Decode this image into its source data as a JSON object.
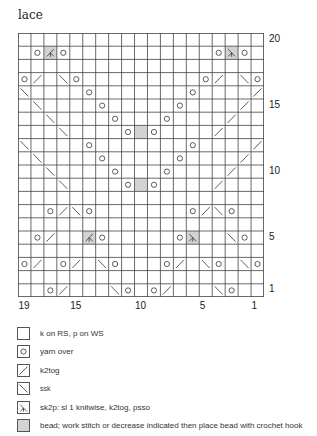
{
  "title": "lace",
  "chart": {
    "columns": 19,
    "rows": 20,
    "row_labels": [
      {
        "label": "20",
        "row": 20
      },
      {
        "label": "15",
        "row": 15
      },
      {
        "label": "10",
        "row": 10
      },
      {
        "label": "5",
        "row": 5
      },
      {
        "label": "1",
        "row": 1
      }
    ],
    "col_labels": [
      {
        "label": "19",
        "col": 19
      },
      {
        "label": "15",
        "col": 15
      },
      {
        "label": "10",
        "col": 10
      },
      {
        "label": "5",
        "col": 5
      },
      {
        "label": "1",
        "col": 1
      }
    ],
    "bead_color": "#d3d3d3",
    "line_color": "#333333",
    "rows_data": {
      "20": [],
      "19": [
        {
          "i": 1,
          "s": "yo"
        },
        {
          "i": 2,
          "s": "sk2p-l",
          "bead": true
        },
        {
          "i": 3,
          "s": "yo"
        },
        {
          "i": 15,
          "s": "yo"
        },
        {
          "i": 16,
          "s": "sk2p-r",
          "bead": true
        },
        {
          "i": 17,
          "s": "yo"
        }
      ],
      "18": [],
      "17": [
        {
          "i": 0,
          "s": "yo"
        },
        {
          "i": 1,
          "s": "k2tog"
        },
        {
          "i": 3,
          "s": "ssk"
        },
        {
          "i": 4,
          "s": "yo"
        },
        {
          "i": 14,
          "s": "yo"
        },
        {
          "i": 15,
          "s": "k2tog"
        },
        {
          "i": 17,
          "s": "ssk"
        },
        {
          "i": 18,
          "s": "yo"
        }
      ],
      "16": [
        {
          "i": 0,
          "s": "ssk"
        },
        {
          "i": 5,
          "s": "yo"
        },
        {
          "i": 13,
          "s": "yo"
        },
        {
          "i": 18,
          "s": "k2tog"
        }
      ],
      "15": [
        {
          "i": 1,
          "s": "ssk"
        },
        {
          "i": 6,
          "s": "yo"
        },
        {
          "i": 12,
          "s": "yo"
        },
        {
          "i": 17,
          "s": "k2tog"
        }
      ],
      "14": [
        {
          "i": 2,
          "s": "ssk"
        },
        {
          "i": 7,
          "s": "yo"
        },
        {
          "i": 11,
          "s": "yo"
        },
        {
          "i": 16,
          "s": "k2tog"
        }
      ],
      "13": [
        {
          "i": 3,
          "s": "ssk"
        },
        {
          "i": 8,
          "s": "yo"
        },
        {
          "i": 9,
          "s": "knit",
          "bead": true
        },
        {
          "i": 10,
          "s": "yo"
        },
        {
          "i": 15,
          "s": "k2tog"
        }
      ],
      "12": [
        {
          "i": 0,
          "s": "ssk"
        },
        {
          "i": 5,
          "s": "yo"
        },
        {
          "i": 13,
          "s": "yo"
        },
        {
          "i": 18,
          "s": "k2tog"
        }
      ],
      "11": [
        {
          "i": 1,
          "s": "ssk"
        },
        {
          "i": 6,
          "s": "yo"
        },
        {
          "i": 12,
          "s": "yo"
        },
        {
          "i": 17,
          "s": "k2tog"
        }
      ],
      "10": [
        {
          "i": 2,
          "s": "ssk"
        },
        {
          "i": 7,
          "s": "yo"
        },
        {
          "i": 11,
          "s": "yo"
        },
        {
          "i": 16,
          "s": "k2tog"
        }
      ],
      "9": [
        {
          "i": 3,
          "s": "ssk"
        },
        {
          "i": 8,
          "s": "yo"
        },
        {
          "i": 9,
          "s": "knit",
          "bead": true
        },
        {
          "i": 10,
          "s": "yo"
        },
        {
          "i": 15,
          "s": "k2tog"
        }
      ],
      "8": [],
      "7": [
        {
          "i": 2,
          "s": "yo"
        },
        {
          "i": 3,
          "s": "k2tog"
        },
        {
          "i": 4,
          "s": "ssk"
        },
        {
          "i": 5,
          "s": "yo"
        },
        {
          "i": 13,
          "s": "yo"
        },
        {
          "i": 14,
          "s": "k2tog"
        },
        {
          "i": 15,
          "s": "ssk"
        },
        {
          "i": 16,
          "s": "yo"
        }
      ],
      "6": [],
      "5": [
        {
          "i": 1,
          "s": "yo"
        },
        {
          "i": 2,
          "s": "k2tog"
        },
        {
          "i": 5,
          "s": "sk2p-l",
          "bead": true
        },
        {
          "i": 6,
          "s": "yo"
        },
        {
          "i": 12,
          "s": "yo"
        },
        {
          "i": 13,
          "s": "sk2p-r",
          "bead": true
        },
        {
          "i": 16,
          "s": "ssk"
        },
        {
          "i": 17,
          "s": "yo"
        }
      ],
      "4": [],
      "3": [
        {
          "i": 0,
          "s": "yo"
        },
        {
          "i": 1,
          "s": "k2tog"
        },
        {
          "i": 3,
          "s": "yo"
        },
        {
          "i": 4,
          "s": "k2tog"
        },
        {
          "i": 6,
          "s": "ssk"
        },
        {
          "i": 7,
          "s": "yo"
        },
        {
          "i": 11,
          "s": "yo"
        },
        {
          "i": 12,
          "s": "k2tog"
        },
        {
          "i": 14,
          "s": "ssk"
        },
        {
          "i": 15,
          "s": "yo"
        },
        {
          "i": 17,
          "s": "ssk"
        },
        {
          "i": 18,
          "s": "yo"
        }
      ],
      "2": [],
      "1": [
        {
          "i": 2,
          "s": "yo"
        },
        {
          "i": 3,
          "s": "k2tog"
        },
        {
          "i": 7,
          "s": "ssk"
        },
        {
          "i": 8,
          "s": "yo"
        },
        {
          "i": 10,
          "s": "yo"
        },
        {
          "i": 11,
          "s": "k2tog"
        },
        {
          "i": 15,
          "s": "ssk"
        },
        {
          "i": 16,
          "s": "yo"
        }
      ]
    }
  },
  "legend": [
    {
      "symbol": "knit",
      "icon": "empty-square-icon",
      "text": "k on RS, p on WS"
    },
    {
      "symbol": "yo",
      "icon": "circle-icon",
      "text": "yarn over"
    },
    {
      "symbol": "k2tog",
      "icon": "slash-right-icon",
      "text": "k2tog"
    },
    {
      "symbol": "ssk",
      "icon": "slash-left-icon",
      "text": "ssk"
    },
    {
      "symbol": "sk2p",
      "icon": "sk2p-icon",
      "text": "sk2p: sl 1 knitwise, k2tog, psso"
    },
    {
      "symbol": "bead",
      "icon": "gray-square-icon",
      "text": "bead; work stitch or decrease indicated then place bead with crochet hook"
    }
  ]
}
